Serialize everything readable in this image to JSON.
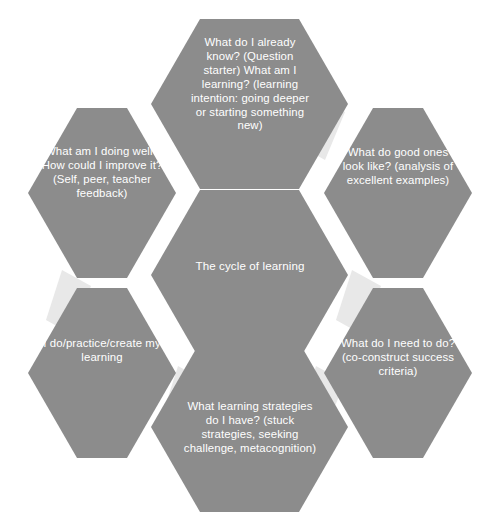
{
  "diagram": {
    "type": "hexagon-cycle",
    "background_color": "#ffffff",
    "hexagon_color": "#8c8c8c",
    "connector_color": "#e8e8e8",
    "label_color": "#ffffff",
    "center": {
      "id": "cycle-of-learning",
      "text": "The cycle of learning"
    },
    "nodes": [
      {
        "id": "already-know",
        "position": "top",
        "text": "What do I already know? (Question starter) What am I learning? (learning intention: going deeper or starting something new)"
      },
      {
        "id": "good-ones-look-like",
        "position": "top-right",
        "text": "What do good ones look like? (analysis of excellent examples)"
      },
      {
        "id": "need-to-do",
        "position": "bottom-right",
        "text": "What do I need to do? (co-construct success criteria)"
      },
      {
        "id": "learning-strategies",
        "position": "bottom",
        "text": "What learning strategies do I have? (stuck strategies, seeking challenge, metacognition)"
      },
      {
        "id": "do-practice-create",
        "position": "bottom-left",
        "text": "I do/practice/create my learning"
      },
      {
        "id": "doing-well-improve",
        "position": "top-left",
        "text": "What am I doing well? How could I improve it? (Self, peer, teacher feedback)"
      }
    ],
    "connectors": [
      {
        "id": "connector-top-to-topright"
      },
      {
        "id": "connector-topright-to-bottomright"
      },
      {
        "id": "connector-bottomright-to-bottom"
      },
      {
        "id": "connector-bottom-to-bottomleft"
      },
      {
        "id": "connector-bottomleft-to-topleft"
      }
    ]
  }
}
